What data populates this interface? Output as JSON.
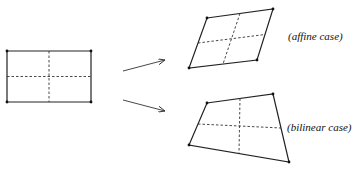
{
  "diagram": {
    "labels": {
      "affine": "(affine case)",
      "bilinear": "(bilinear case)"
    },
    "colors": {
      "stroke": "#222222",
      "background": "#ffffff"
    },
    "shapes": {
      "reference": {
        "corners": [
          [
            7,
            51
          ],
          [
            91,
            51
          ],
          [
            91,
            102
          ],
          [
            7,
            102
          ]
        ],
        "style": "solid",
        "subdivision": "dashed midlines"
      },
      "affine": {
        "corners": [
          [
            207,
            18
          ],
          [
            273,
            9
          ],
          [
            257,
            60
          ],
          [
            189,
            68
          ]
        ],
        "style": "solid",
        "subdivision": "dashed midlines"
      },
      "bilinear": {
        "corners": [
          [
            207,
            103
          ],
          [
            273,
            94
          ],
          [
            289,
            162
          ],
          [
            189,
            145
          ]
        ],
        "style": "solid",
        "subdivision": "dashed midlines"
      }
    },
    "arrows": [
      {
        "from": [
          123,
          71
        ],
        "to": [
          165,
          60
        ],
        "target": "affine"
      },
      {
        "from": [
          123,
          100
        ],
        "to": [
          165,
          111
        ],
        "target": "bilinear"
      }
    ]
  }
}
